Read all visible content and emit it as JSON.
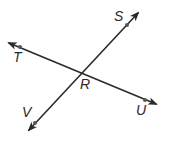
{
  "diagram": {
    "type": "intersecting-lines",
    "intersection": {
      "label": "R",
      "x": 80,
      "y": 72,
      "label_x": 80,
      "label_y": 89
    },
    "lines": [
      {
        "name": "line-TU",
        "from": {
          "x": 9,
          "y": 43
        },
        "to": {
          "x": 156,
          "y": 104
        },
        "points": [
          {
            "label": "T",
            "x": 20,
            "y": 47,
            "label_x": 13,
            "label_y": 62
          },
          {
            "label": "U",
            "x": 145,
            "y": 100,
            "label_x": 136,
            "label_y": 115
          }
        ]
      },
      {
        "name": "line-SV",
        "from": {
          "x": 138,
          "y": 13
        },
        "to": {
          "x": 29,
          "y": 130
        },
        "points": [
          {
            "label": "S",
            "x": 127,
            "y": 25,
            "label_x": 114,
            "label_y": 21
          },
          {
            "label": "V",
            "x": 35,
            "y": 123,
            "label_x": 22,
            "label_y": 117
          }
        ]
      }
    ],
    "colors": {
      "line": "#2b2b2b",
      "point": "#555555",
      "label": "#2a2a2a",
      "background": "#ffffff"
    }
  }
}
